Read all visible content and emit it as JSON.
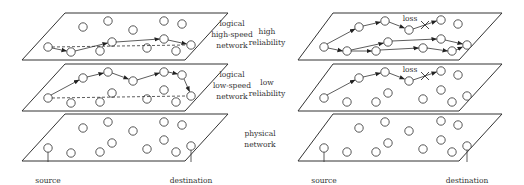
{
  "left_diagram": {
    "layers": [
      {
        "label_lines": [
          "logical",
          "high-speed",
          "network"
        ]
      },
      {
        "label_lines": [
          "logical",
          "low-speed",
          "network"
        ]
      },
      {
        "label_lines": [
          "physical",
          "network"
        ]
      }
    ],
    "source_label": "source",
    "destination_label": "destination"
  },
  "right_diagram": {
    "layers": [
      {
        "label_lines": [
          "high",
          "reliability"
        ],
        "loss_label": "loss"
      },
      {
        "label_lines": [
          "low",
          "reliability"
        ],
        "loss_label": "loss"
      }
    ],
    "source_label": "source",
    "destination_label": "destination"
  }
}
